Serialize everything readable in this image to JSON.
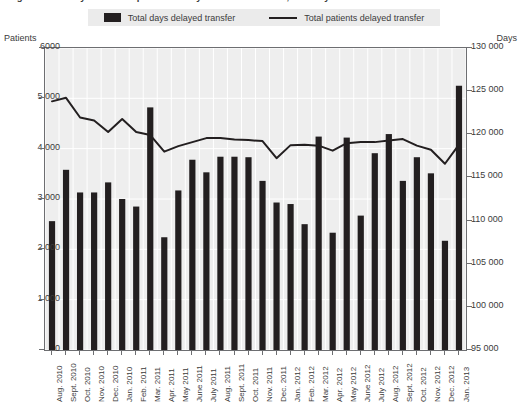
{
  "title": "Figure: Total days and total patients delayed transfer of care, monthly",
  "legend": {
    "items": [
      {
        "label": "Total days delayed transfer",
        "marker": "bar-swatch",
        "color": "#231f20"
      },
      {
        "label": "Total patients delayed transfer",
        "marker": "line-swatch",
        "color": "#231f20"
      }
    ]
  },
  "axes": {
    "left_title": "Patients",
    "right_title": "Days",
    "left_ticks": [
      "6000",
      "5 000",
      "4 000",
      "3 000",
      "2 000",
      "1 000",
      "0"
    ],
    "right_ticks": [
      "130 000",
      "125 000",
      "120 000",
      "115 000",
      "110 000",
      "105 000",
      "100 000",
      "95 000"
    ]
  },
  "chart_data": {
    "type": "bar",
    "title": "Total days and total patients delayed transfer of care, monthly",
    "xlabel": "",
    "ylabel": "Patients",
    "y2label": "Days",
    "ylim": [
      0,
      6000
    ],
    "y2lim": [
      95000,
      130000
    ],
    "grid": true,
    "legend_position": "top",
    "categories": [
      "Aug. 2010",
      "Sept. 2010",
      "Oct. 2010",
      "Nov. 2010",
      "Dec. 2010",
      "Jan. 2010",
      "Feb. 2011",
      "Mar. 2011",
      "Apr. 2011",
      "May 2011",
      "June 2011",
      "July 2011",
      "Aug. 2011",
      "Sept. 2011",
      "Oct. 2011",
      "Nov. 2011",
      "Dec. 2011",
      "Jan. 2012",
      "Feb. 2012",
      "Mar. 2012",
      "Apr. 2012",
      "May 2012",
      "June 2012",
      "July 2012",
      "Aug. 2012",
      "Sept. 2012",
      "Oct. 2012",
      "Nov. 2012",
      "Dec. 2012",
      "Jan. 2013"
    ],
    "series": [
      {
        "name": "Total days delayed transfer",
        "type": "bar",
        "axis": "right",
        "unit": "days",
        "values": [
          110500,
          116000,
          113500,
          113500,
          115000,
          113500,
          112500,
          123000,
          108000,
          113500,
          117000,
          115500,
          117500,
          117500,
          117500,
          114500,
          112000,
          112000,
          109500,
          119500,
          108500,
          119500,
          110500,
          117500,
          120000,
          114500,
          117500,
          115500,
          107500,
          125500
        ],
        "values_patients_scale": [
          2560,
          3580,
          3130,
          3130,
          3330,
          3000,
          2850,
          4820,
          2240,
          3170,
          3780,
          3530,
          3840,
          3840,
          3830,
          3360,
          2930,
          2900,
          2500,
          4240,
          2330,
          4220,
          2670,
          3910,
          4290,
          3360,
          3830,
          3510,
          2170,
          5250
        ]
      },
      {
        "name": "Total patients delayed transfer",
        "type": "line",
        "axis": "left",
        "unit": "patients",
        "values": [
          4940,
          5010,
          4620,
          4560,
          4330,
          4590,
          4330,
          4270,
          3940,
          4050,
          4130,
          4210,
          4210,
          4180,
          4170,
          4150,
          3810,
          4070,
          4080,
          4060,
          3960,
          4110,
          4130,
          4130,
          4160,
          4190,
          4060,
          3980,
          3700,
          4080
        ]
      }
    ]
  }
}
